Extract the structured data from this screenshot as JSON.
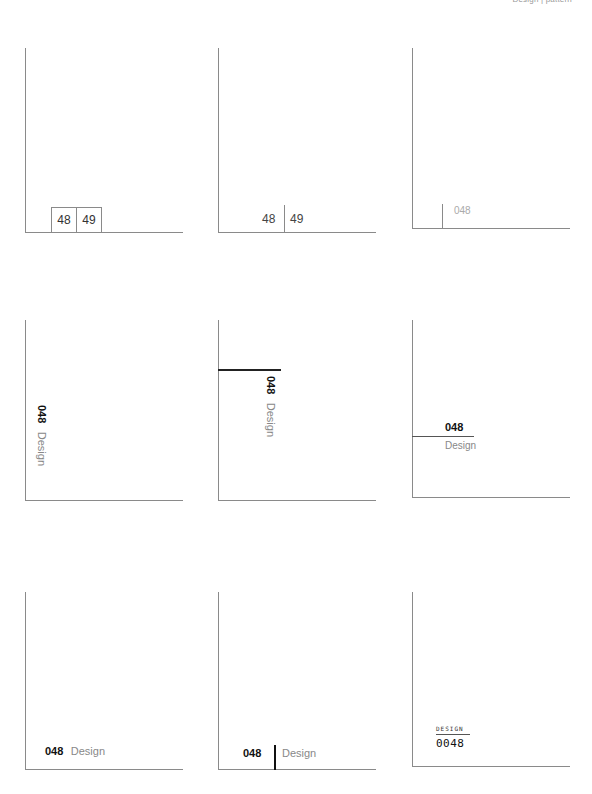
{
  "header": {
    "text": "Design | pattern"
  },
  "panels": [
    {
      "id": 1,
      "numbers": [
        "48",
        "49"
      ],
      "style": "boxed-pages"
    },
    {
      "id": 2,
      "numbers": [
        "48",
        "49"
      ],
      "style": "divided-pages"
    },
    {
      "id": 3,
      "number": "048",
      "style": "light-marker"
    },
    {
      "id": 4,
      "number": "048",
      "label": "Design",
      "style": "vertical-rotated"
    },
    {
      "id": 5,
      "number": "048",
      "label": "Design",
      "style": "vertical-with-rule"
    },
    {
      "id": 6,
      "number": "048",
      "label": "Design",
      "style": "stacked-with-rule"
    },
    {
      "id": 7,
      "number": "048",
      "label": "Design",
      "style": "inline"
    },
    {
      "id": 8,
      "number": "048",
      "label": "Design",
      "style": "inline-with-bar"
    },
    {
      "id": 9,
      "number": "0048",
      "label": "DESIGN",
      "style": "digital"
    }
  ]
}
